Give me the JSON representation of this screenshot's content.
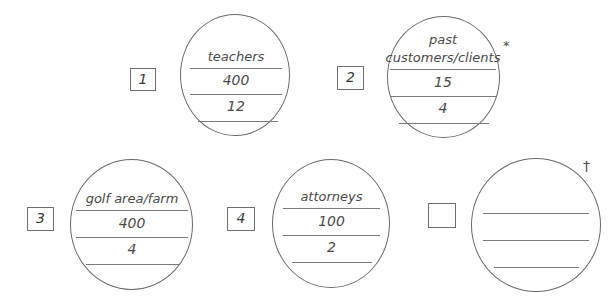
{
  "worksheet": {
    "items": [
      {
        "box_label": "1",
        "lines": [
          "teachers",
          "400",
          "12"
        ],
        "mark": ""
      },
      {
        "box_label": "2",
        "lines": [
          "past",
          "customers/clients",
          "15",
          "4"
        ],
        "mark": "*"
      },
      {
        "box_label": "3",
        "lines": [
          "golf area/farm",
          "400",
          "4"
        ],
        "mark": ""
      },
      {
        "box_label": "4",
        "lines": [
          "attorneys",
          "100",
          "2"
        ],
        "mark": ""
      },
      {
        "box_label": "",
        "lines": [
          "",
          "",
          ""
        ],
        "mark": "†"
      }
    ]
  }
}
